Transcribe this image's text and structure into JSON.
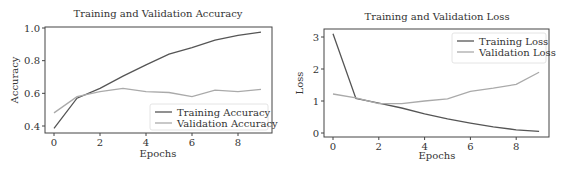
{
  "chart_data": [
    {
      "type": "line",
      "title": "Training and Validation Accuracy",
      "xlabel": "Epochs",
      "ylabel": "Accuracy",
      "x": [
        0,
        1,
        2,
        3,
        4,
        5,
        6,
        7,
        8,
        9
      ],
      "xticks": [
        0,
        2,
        4,
        6,
        8
      ],
      "yticks": [
        0.4,
        0.6,
        0.8,
        1.0
      ],
      "ytick_labels": [
        "0.4",
        "0.6",
        "0.8",
        "1.0"
      ],
      "ylim": [
        0.36,
        1.0
      ],
      "legend_position": "lower right",
      "series": [
        {
          "name": "Training Accuracy",
          "color": "#555555",
          "values": [
            0.385,
            0.57,
            0.63,
            0.705,
            0.775,
            0.84,
            0.88,
            0.925,
            0.955,
            0.975
          ]
        },
        {
          "name": "Validation Accuracy",
          "color": "#aaaaaa",
          "values": [
            0.48,
            0.58,
            0.61,
            0.63,
            0.61,
            0.605,
            0.58,
            0.62,
            0.61,
            0.625
          ]
        }
      ]
    },
    {
      "type": "line",
      "title": "Training and Validation Loss",
      "xlabel": "Epochs",
      "ylabel": "Loss",
      "x": [
        0,
        1,
        2,
        3,
        4,
        5,
        6,
        7,
        8,
        9
      ],
      "xticks": [
        0,
        2,
        4,
        6,
        8
      ],
      "yticks": [
        0,
        1,
        2,
        3
      ],
      "ytick_labels": [
        "0",
        "1",
        "2",
        "3"
      ],
      "ylim": [
        -0.05,
        3.25
      ],
      "legend_position": "upper right",
      "series": [
        {
          "name": "Training Loss",
          "color": "#555555",
          "values": [
            3.1,
            1.08,
            0.93,
            0.78,
            0.6,
            0.44,
            0.31,
            0.19,
            0.1,
            0.05
          ]
        },
        {
          "name": "Validation Loss",
          "color": "#aaaaaa",
          "values": [
            1.22,
            1.1,
            0.92,
            0.92,
            1.0,
            1.07,
            1.3,
            1.4,
            1.52,
            1.9
          ]
        }
      ]
    }
  ]
}
